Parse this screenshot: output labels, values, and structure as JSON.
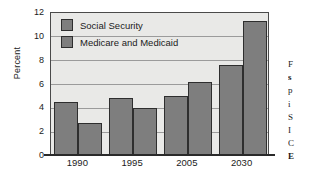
{
  "chart_data": {
    "type": "bar",
    "title": "",
    "xlabel": "",
    "ylabel": "Percent",
    "ylim": [
      0,
      12
    ],
    "yticks": [
      0,
      2,
      4,
      6,
      8,
      10,
      12
    ],
    "grid": true,
    "legend_position": "top-left inside plot",
    "categories": [
      "1990",
      "1995",
      "2005",
      "2030"
    ],
    "series": [
      {
        "name": "Social Security",
        "values": [
          4.5,
          4.9,
          5.0,
          7.6
        ],
        "color": "#7e7e7e"
      },
      {
        "name": "Medicare and Medicaid",
        "values": [
          2.8,
          4.0,
          6.2,
          11.3
        ],
        "color": "#7e7e7e"
      }
    ]
  },
  "axes": {
    "ylabel": "Percent",
    "ytick_labels": [
      "12",
      "10",
      "8",
      "6",
      "4",
      "2",
      "0"
    ],
    "xtick_labels": [
      "1990",
      "1995",
      "2005",
      "2030"
    ]
  },
  "legend": {
    "items": [
      {
        "label": "Social Security"
      },
      {
        "label": "Medicare and Medicaid"
      }
    ]
  },
  "caption_fragment": {
    "lines": [
      "F",
      "s",
      "p",
      "i",
      "S",
      "I",
      "C",
      "E"
    ]
  },
  "colors": {
    "bar_fill": "#7e7e7e",
    "bar_edge": "#2e2e2e",
    "plot_background": "#e9e9e7",
    "gridline": "#9b9b9b",
    "axis": "#2a2a2a",
    "text": "#1b1b1b",
    "page_background": "#ffffff"
  }
}
